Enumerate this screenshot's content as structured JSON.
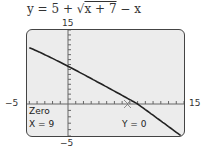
{
  "equation": {
    "prefix": "y = 5 + ",
    "radical": "x + 7",
    "suffix": " − x"
  },
  "window": {
    "xmin_label": "−5",
    "xmax_label": "15",
    "ymax_label": "15",
    "ymin_label": "−5"
  },
  "trace": {
    "mode": "Zero",
    "x_label": "X = 9",
    "y_label": "Y = 0"
  },
  "chart_data": {
    "type": "line",
    "xlabel": "",
    "ylabel": "",
    "xlim": [
      -5,
      15
    ],
    "ylim": [
      -5,
      15
    ],
    "x": [
      -5,
      0,
      5,
      9,
      13,
      15
    ],
    "values": [
      11.41,
      7.65,
      3.46,
      0,
      -3.53,
      -5.2
    ],
    "annotations": [
      "Zero",
      "X = 9",
      "Y = 0"
    ],
    "grid": false,
    "tick_spacing": 1
  }
}
